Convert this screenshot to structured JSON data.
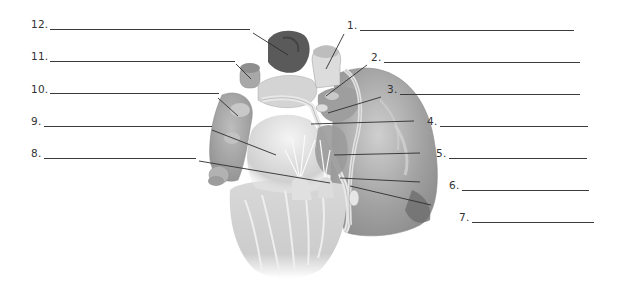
{
  "diagram": {
    "labels": [
      {
        "number": "1.",
        "side": "right",
        "text_x": 347,
        "text_y": 19,
        "line_x1": 360,
        "line_x2": 574,
        "line_y": 30,
        "leader": [
          344,
          34,
          326,
          69
        ]
      },
      {
        "number": "2.",
        "side": "right",
        "text_x": 371,
        "text_y": 51,
        "line_x1": 384,
        "line_x2": 580,
        "line_y": 62,
        "leader": [
          367,
          65,
          326,
          96
        ]
      },
      {
        "number": "3.",
        "side": "right",
        "text_x": 387,
        "text_y": 83,
        "line_x1": 400,
        "line_x2": 580,
        "line_y": 94,
        "leader": [
          381,
          97,
          328,
          113
        ]
      },
      {
        "number": "4.",
        "side": "right",
        "text_x": 427,
        "text_y": 115,
        "line_x1": 440,
        "line_x2": 588,
        "line_y": 126,
        "leader": [
          414,
          121,
          311,
          124
        ]
      },
      {
        "number": "5.",
        "side": "right",
        "text_x": 436,
        "text_y": 147,
        "line_x1": 449,
        "line_x2": 587,
        "line_y": 158,
        "leader": [
          420,
          153,
          334,
          155
        ]
      },
      {
        "number": "6.",
        "side": "right",
        "text_x": 449,
        "text_y": 179,
        "line_x1": 462,
        "line_x2": 589,
        "line_y": 190,
        "leader": [
          420,
          182,
          340,
          178
        ]
      },
      {
        "number": "7.",
        "side": "right",
        "text_x": 459,
        "text_y": 211,
        "line_x1": 472,
        "line_x2": 594,
        "line_y": 222,
        "leader": [
          431,
          205,
          350,
          186
        ]
      },
      {
        "number": "8.",
        "side": "left",
        "text_x": 31,
        "text_y": 147,
        "line_x1": 44,
        "line_x2": 196,
        "line_y": 158,
        "leader": [
          199,
          161,
          330,
          183
        ]
      },
      {
        "number": "9.",
        "side": "left",
        "text_x": 31,
        "text_y": 115,
        "line_x1": 44,
        "line_x2": 212,
        "line_y": 126,
        "leader": [
          212,
          130,
          276,
          155
        ]
      },
      {
        "number": "10.",
        "side": "left",
        "text_x": 31,
        "text_y": 83,
        "line_x1": 50,
        "line_x2": 219,
        "line_y": 93,
        "leader": [
          218,
          98,
          238,
          116
        ]
      },
      {
        "number": "11.",
        "side": "left",
        "text_x": 31,
        "text_y": 50,
        "line_x1": 50,
        "line_x2": 235,
        "line_y": 61,
        "leader": [
          236,
          64,
          251,
          79
        ]
      },
      {
        "number": "12.",
        "side": "left",
        "text_x": 31,
        "text_y": 18,
        "line_x1": 50,
        "line_x2": 250,
        "line_y": 29,
        "leader": [
          253,
          33,
          288,
          55
        ]
      }
    ]
  },
  "colors": {
    "text": "#333333",
    "line": "#3a3a3a",
    "tissue_light": "#e6e6e6",
    "tissue_mid": "#b5b5b5",
    "tissue_dark": "#7a7a7a",
    "vessel_dark": "#555555"
  }
}
